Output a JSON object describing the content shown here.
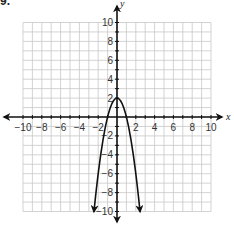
{
  "figure_label": "9.",
  "chart_data": {
    "type": "line",
    "title": "",
    "xlabel": "x",
    "ylabel": "y",
    "xlim": [
      -10,
      10
    ],
    "ylim": [
      -10,
      10
    ],
    "grid": true,
    "grid_step": 1,
    "x_ticks": [
      -10,
      -8,
      -6,
      -4,
      -2,
      2,
      4,
      6,
      8,
      10
    ],
    "y_ticks": [
      10,
      8,
      6,
      4,
      2,
      -2,
      -4,
      -6,
      -8,
      -10
    ],
    "x_tick_labels": [
      "−10",
      "−8",
      "−6",
      "−4",
      "−2",
      "2",
      "4",
      "6",
      "8",
      "10"
    ],
    "y_tick_labels": [
      "10",
      "8",
      "6",
      "4",
      "2",
      "−2",
      "−4",
      "−6",
      "−8",
      "−10"
    ],
    "legend": null,
    "series": [
      {
        "name": "parabola",
        "description": "Downward-opening parabola with vertex at (0, 2), arrows at both ends",
        "equation_estimate": "y = -2x^2 + 2",
        "vertex": [
          0,
          2
        ],
        "x_intercepts": [
          -1,
          1
        ],
        "endpoints": [
          [
            -2.45,
            -10
          ],
          [
            2.45,
            -10
          ]
        ],
        "points": [
          [
            -2.45,
            -10
          ],
          [
            -2,
            -6
          ],
          [
            -1.5,
            -2.5
          ],
          [
            -1,
            0
          ],
          [
            -0.5,
            1.5
          ],
          [
            0,
            2
          ],
          [
            0.5,
            1.5
          ],
          [
            1,
            0
          ],
          [
            1.5,
            -2.5
          ],
          [
            2,
            -6
          ],
          [
            2.45,
            -10
          ]
        ]
      }
    ]
  }
}
